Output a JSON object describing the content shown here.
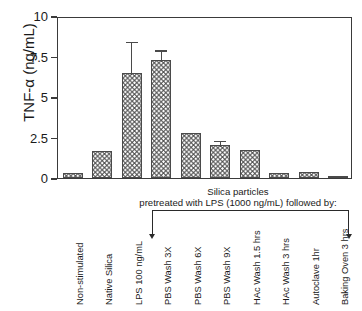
{
  "chart_data": {
    "type": "bar",
    "title": "",
    "xlabel": "",
    "ylabel": "TNF-α (ng/mL)",
    "ylim": [
      0,
      10
    ],
    "yticks": [
      "0",
      "2.5",
      "5",
      "7.5",
      "10"
    ],
    "ytick_values": [
      0,
      2.5,
      5,
      7.5,
      10
    ],
    "grid": false,
    "legend": "none",
    "categories": [
      "Non-stimulated",
      "Native Silica",
      "LPS 100 ng/mL",
      "PBS Wash 3X",
      "PBS Wash 6X",
      "PBS Wash 9X",
      "HAc Wash 1.5 hrs",
      "HAc Wash 3 hrs",
      "Autoclave 1hr",
      "Baking Oven 3 hrs"
    ],
    "values": [
      0.3,
      1.65,
      6.5,
      7.3,
      2.8,
      2.05,
      1.75,
      0.3,
      0.4,
      0.15
    ],
    "errors": [
      0,
      0,
      2.0,
      0.7,
      0,
      0.35,
      0,
      0,
      0,
      0
    ],
    "annotations": {
      "group_line_1": "Silica particles",
      "group_line_2": "pretreated with LPS (1000 ng/mL) followed by:",
      "group_span_first": "PBS Wash 3X",
      "group_span_last": "Baking Oven 3 hrs"
    }
  },
  "axes": {
    "y_title": "TNF-α (ng/mL)"
  }
}
